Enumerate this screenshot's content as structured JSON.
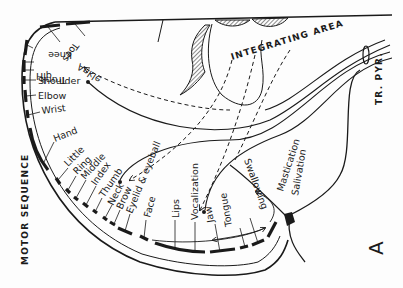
{
  "diagram": {
    "title_label": "INTEGRATING AREA",
    "tract_label": "TR. PYR.",
    "sequence_label": "MOTOR SEQUENCE",
    "panel_letter": "A",
    "colors": {
      "ink": "#1a1a1a",
      "background": "#fdfdfd"
    },
    "body_parts": [
      "Toes",
      "Ankle",
      "Knee",
      "Hip",
      "Trunk",
      "Shoulder",
      "Elbow",
      "Wrist",
      "Hand",
      "Little",
      "Ring",
      "Middle",
      "Index",
      "Thumb",
      "Neck",
      "Brow",
      "Eyelid & eyeball",
      "Face",
      "Lips",
      "Vocalization",
      "Jaw",
      "Tongue",
      "Swallowing"
    ],
    "outside_labels": [
      "Mastication",
      "Salivation"
    ]
  }
}
